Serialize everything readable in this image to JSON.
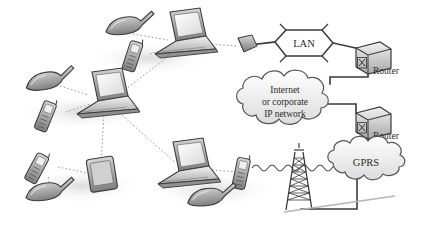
{
  "diagram": {
    "background_color": "#ffffff",
    "ink_color": "#3a3a3a",
    "device_fill": "#b9b9b9",
    "shadow_color": "#e8e8e8",
    "dotted_link_color": "#9a9a9a",
    "solid_link_color": "#3a3a3a"
  },
  "labels": {
    "lan": "LAN",
    "router_top": "Router",
    "router_bottom": "Router",
    "internet_line1": "Internet",
    "internet_line2": "or corporate",
    "internet_line3": "IP network",
    "gprs": "GPRS"
  },
  "nodes": [
    {
      "id": "headset-top",
      "name": "headset-top",
      "kind": "headset",
      "x": 118,
      "y": 30
    },
    {
      "id": "phone-top",
      "name": "mobile-phone-top",
      "kind": "phone",
      "x": 138,
      "y": 52
    },
    {
      "id": "laptop-top",
      "name": "laptop-top",
      "kind": "laptop",
      "x": 185,
      "y": 38
    },
    {
      "id": "access-point",
      "name": "wireless-access-point",
      "kind": "access-point",
      "x": 246,
      "y": 45
    },
    {
      "id": "lan-bus",
      "name": "lan-segment",
      "kind": "lan",
      "x": 305,
      "y": 43
    },
    {
      "id": "router-top",
      "name": "router-top",
      "kind": "router",
      "x": 368,
      "y": 58
    },
    {
      "id": "headset-mid",
      "name": "headset-middle-left",
      "kind": "headset",
      "x": 42,
      "y": 85
    },
    {
      "id": "phone-mid",
      "name": "mobile-phone-middle",
      "kind": "phone",
      "x": 52,
      "y": 113
    },
    {
      "id": "laptop-mid",
      "name": "laptop-middle",
      "kind": "laptop",
      "x": 105,
      "y": 98
    },
    {
      "id": "phone-bl",
      "name": "mobile-phone-bottom-left",
      "kind": "phone",
      "x": 44,
      "y": 165
    },
    {
      "id": "headset-bl",
      "name": "headset-bottom-left",
      "kind": "headset",
      "x": 45,
      "y": 195
    },
    {
      "id": "pda-bl",
      "name": "pda-device",
      "kind": "pda",
      "x": 100,
      "y": 176
    },
    {
      "id": "laptop-bottom",
      "name": "laptop-bottom",
      "kind": "laptop",
      "x": 188,
      "y": 168
    },
    {
      "id": "phone-bottom",
      "name": "mobile-phone-bottom",
      "kind": "phone",
      "x": 243,
      "y": 172
    },
    {
      "id": "headset-bottom",
      "name": "headset-bottom",
      "kind": "headset",
      "x": 208,
      "y": 200
    },
    {
      "id": "cell-tower",
      "name": "cell-tower",
      "kind": "tower",
      "x": 299,
      "y": 185
    },
    {
      "id": "internet-cloud",
      "name": "internet-cloud",
      "kind": "cloud",
      "x": 285,
      "y": 105
    },
    {
      "id": "router-bottom",
      "name": "router-bottom",
      "kind": "router",
      "x": 368,
      "y": 124
    },
    {
      "id": "gprs-cloud",
      "name": "gprs-cloud",
      "kind": "cloud",
      "x": 366,
      "y": 162
    }
  ],
  "links": [
    {
      "from": "headset-top",
      "to": "laptop-top",
      "style": "dotted"
    },
    {
      "from": "phone-top",
      "to": "laptop-top",
      "style": "dotted"
    },
    {
      "from": "laptop-top",
      "to": "access-point",
      "style": "dotted"
    },
    {
      "from": "laptop-mid",
      "to": "laptop-top",
      "style": "dotted"
    },
    {
      "from": "headset-mid",
      "to": "laptop-mid",
      "style": "dotted"
    },
    {
      "from": "phone-mid",
      "to": "laptop-mid",
      "style": "dotted"
    },
    {
      "from": "laptop-mid",
      "to": "pda-bl",
      "style": "dotted"
    },
    {
      "from": "laptop-mid",
      "to": "laptop-bottom",
      "style": "dotted"
    },
    {
      "from": "phone-bl",
      "to": "pda-bl",
      "style": "dotted"
    },
    {
      "from": "headset-bl",
      "to": "phone-bl",
      "style": "dotted"
    },
    {
      "from": "laptop-bottom",
      "to": "phone-bottom",
      "style": "dotted"
    },
    {
      "from": "headset-bottom",
      "to": "phone-bottom",
      "style": "dotted"
    },
    {
      "from": "phone-bottom",
      "to": "cell-tower",
      "style": "radio-wave"
    },
    {
      "from": "access-point",
      "to": "lan-bus",
      "style": "solid"
    },
    {
      "from": "lan-bus",
      "to": "router-top",
      "style": "solid"
    },
    {
      "from": "router-top",
      "to": "internet-cloud",
      "style": "solid"
    },
    {
      "from": "internet-cloud",
      "to": "router-bottom",
      "style": "solid"
    },
    {
      "from": "router-bottom",
      "to": "gprs-cloud",
      "style": "solid"
    },
    {
      "from": "gprs-cloud",
      "to": "cell-tower",
      "style": "solid"
    }
  ]
}
